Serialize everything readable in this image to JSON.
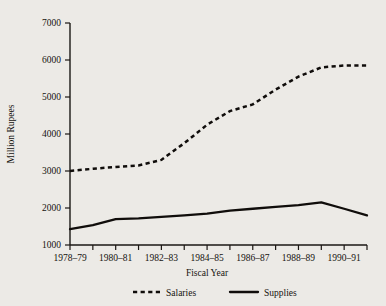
{
  "chart_data": {
    "type": "line",
    "title": "",
    "xlabel": "Fiscal Year",
    "ylabel": "Million Rupees",
    "ylim": [
      1000,
      7000
    ],
    "ytick_values": [
      1000,
      2000,
      3000,
      4000,
      5000,
      6000,
      7000
    ],
    "ytick_labels": [
      "1000",
      "2000",
      "3000",
      "4000",
      "5000",
      "6000",
      "7000"
    ],
    "grid": false,
    "legend_position": "bottom",
    "categories": [
      "1978-79",
      "1979-80",
      "1980-81",
      "1981-82",
      "1982-83",
      "1983-84",
      "1984-85",
      "1985-86",
      "1986-87",
      "1987-88",
      "1988-89",
      "1989-90",
      "1990-91",
      "1991-92"
    ],
    "xtick_labels_visible": [
      "1978-79",
      "1980-81",
      "1982-83",
      "1984-85",
      "1986-87",
      "1988-89",
      "1990-91"
    ],
    "series": [
      {
        "name": "Salaries",
        "style": "dashed",
        "color": "#100d0b",
        "values": [
          3000,
          3060,
          3110,
          3150,
          3300,
          3750,
          4250,
          4620,
          4800,
          5200,
          5550,
          5800,
          5850,
          5850
        ]
      },
      {
        "name": "Supplies",
        "style": "solid",
        "color": "#100d0b",
        "values": [
          1430,
          1540,
          1700,
          1720,
          1760,
          1800,
          1850,
          1930,
          1980,
          2030,
          2080,
          2150,
          1980,
          1800
        ]
      }
    ]
  },
  "legend": {
    "items": [
      {
        "label": "Salaries",
        "style": "dashed"
      },
      {
        "label": "Supplies",
        "style": "solid"
      }
    ]
  }
}
